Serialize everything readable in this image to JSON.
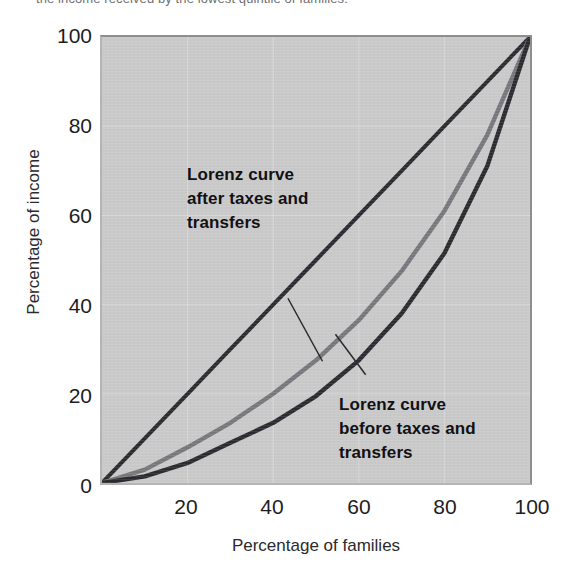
{
  "caption": {
    "text": "the income received by the lowest quintile of families."
  },
  "chart_data": {
    "type": "line",
    "title": "",
    "xlabel": "Percentage of families",
    "ylabel": "Percentage of income",
    "xlim": [
      0,
      100
    ],
    "ylim": [
      0,
      100
    ],
    "xticks": [
      20,
      40,
      60,
      80,
      100
    ],
    "yticks": [
      0,
      20,
      40,
      60,
      80,
      100
    ],
    "grid": true,
    "legend_position": "none",
    "plot_background_color": "#c9c9c9",
    "gridline_color": "#f2f2f2",
    "series": [
      {
        "name": "Line of perfect equality",
        "color": "#2b2b30",
        "labeled": false,
        "x": [
          0,
          10,
          20,
          30,
          40,
          50,
          60,
          70,
          80,
          90,
          100
        ],
        "values": [
          0,
          10,
          20,
          30,
          40,
          50,
          60,
          70,
          80,
          90,
          100
        ]
      },
      {
        "name": "Lorenz curve after taxes and transfers",
        "color": "#77777c",
        "labeled": true,
        "x": [
          0,
          10,
          20,
          30,
          40,
          50,
          60,
          70,
          80,
          90,
          100
        ],
        "values": [
          0,
          3,
          8,
          13.5,
          20,
          27.5,
          36.5,
          47.5,
          61,
          78,
          100
        ]
      },
      {
        "name": "Lorenz curve before taxes and transfers",
        "color": "#2b2b30",
        "labeled": true,
        "x": [
          0,
          10,
          20,
          30,
          40,
          50,
          60,
          70,
          80,
          90,
          100
        ],
        "values": [
          0,
          1.5,
          4.5,
          9,
          13.5,
          19.5,
          27.5,
          38,
          51.5,
          71,
          100
        ]
      }
    ],
    "annotations": [
      {
        "id": "after",
        "lines": [
          "Lorenz curve",
          "after taxes and",
          "transfers"
        ],
        "pointer_from": [
          43.5,
          41.5
        ],
        "pointer_to": [
          51.5,
          27.5
        ]
      },
      {
        "id": "before",
        "lines": [
          "Lorenz curve",
          "before taxes and",
          "transfers"
        ],
        "pointer_from": [
          61.5,
          24.5
        ],
        "pointer_to": [
          54.5,
          33.5
        ]
      }
    ]
  }
}
